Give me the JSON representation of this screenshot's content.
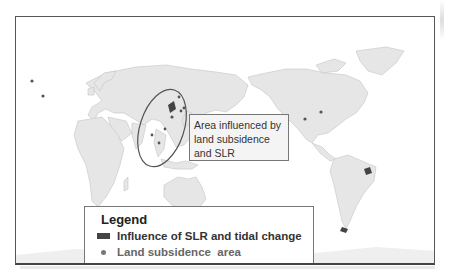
{
  "figure": {
    "projection": "Pacific-centered world map",
    "colors": {
      "land": "#e6e6e6",
      "coast": "#bdbdbd",
      "ocean": "#ffffff",
      "slr_tidal": "#444444",
      "subsidence_dot": "#666666",
      "frame": "#555555"
    }
  },
  "callout": {
    "line1": "Area influenced by",
    "line2": "land subsidence",
    "line3": "and SLR"
  },
  "legend": {
    "title": "Legend",
    "items": [
      {
        "symbol": "dark-rectangle",
        "label": "Influence of SLR and tidal change"
      },
      {
        "symbol": "gray-dot",
        "label": "Land subsidence  area"
      }
    ]
  },
  "markers": {
    "subsidence_points": [
      {
        "region": "Western Europe"
      },
      {
        "region": "Northern Italy"
      },
      {
        "region": "Bangladesh"
      },
      {
        "region": "Eastern China"
      },
      {
        "region": "Japan"
      },
      {
        "region": "Southeast Asia"
      },
      {
        "region": "Mexico City"
      },
      {
        "region": "US Gulf Coast"
      }
    ]
  }
}
